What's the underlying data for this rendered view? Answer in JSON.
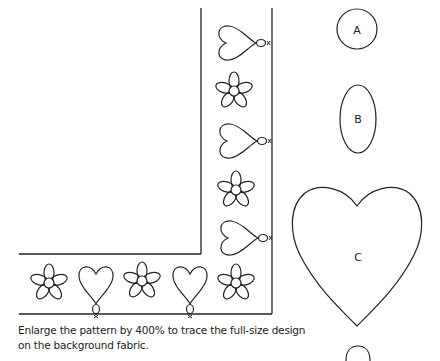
{
  "pattern": {
    "border_motifs_vertical": [
      "heart-balloon",
      "flower",
      "heart-balloon",
      "flower",
      "heart-balloon"
    ],
    "border_motifs_horizontal": [
      "flower",
      "heart-balloon",
      "flower",
      "heart-balloon",
      "flower"
    ]
  },
  "templates": [
    {
      "label": "A",
      "shape": "circle"
    },
    {
      "label": "B",
      "shape": "oval"
    },
    {
      "label": "C",
      "shape": "heart"
    }
  ],
  "caption": "Enlarge the pattern by 400% to trace the full-size design on the background fabric.",
  "colors": {
    "line": "#222222",
    "background": "#ffffff"
  }
}
